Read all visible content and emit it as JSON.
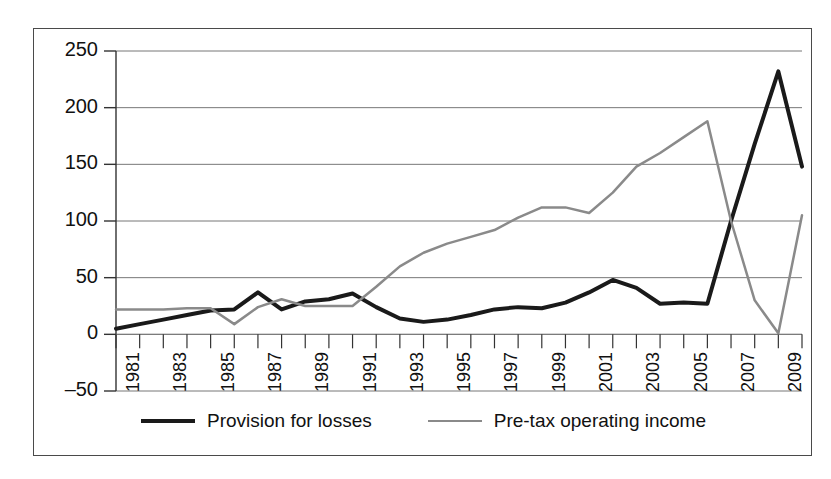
{
  "chart_data": {
    "type": "line",
    "title": "",
    "subtitle": "",
    "xlabel": "",
    "ylabel": "",
    "grid": true,
    "legend_position": "bottom",
    "ylim": [
      -50,
      250
    ],
    "yticks": [
      -50,
      0,
      50,
      100,
      150,
      200,
      250
    ],
    "ytick_labels": [
      "–50",
      "0",
      "50",
      "100",
      "150",
      "200",
      "250"
    ],
    "x": [
      1981,
      1982,
      1983,
      1984,
      1985,
      1986,
      1987,
      1988,
      1989,
      1990,
      1991,
      1992,
      1993,
      1994,
      1995,
      1996,
      1997,
      1998,
      1999,
      2000,
      2001,
      2002,
      2003,
      2004,
      2005,
      2006,
      2007,
      2008,
      2009,
      2010
    ],
    "xtick_labels": [
      "1981",
      "1983",
      "1985",
      "1987",
      "1989",
      "1991",
      "1993",
      "1995",
      "1997",
      "1999",
      "2001",
      "2003",
      "2005",
      "2007",
      "2009"
    ],
    "xtick_values": [
      1981,
      1983,
      1985,
      1987,
      1989,
      1991,
      1993,
      1995,
      1997,
      1999,
      2001,
      2003,
      2005,
      2007,
      2009
    ],
    "xlim": [
      1981,
      2010
    ],
    "series": [
      {
        "name": "Provision for losses",
        "color": "#1a1a1a",
        "width": 4,
        "values": [
          5,
          9,
          13,
          17,
          21,
          22,
          37,
          22,
          29,
          31,
          36,
          24,
          14,
          11,
          13,
          17,
          22,
          24,
          23,
          28,
          37,
          48,
          41,
          27,
          28,
          27,
          100,
          168,
          232,
          148
        ]
      },
      {
        "name": "Pre-tax operating income",
        "color": "#8a8a8a",
        "width": 2.5,
        "values": [
          22,
          22,
          22,
          23,
          23,
          9,
          24,
          31,
          25,
          25,
          25,
          42,
          60,
          72,
          80,
          86,
          92,
          103,
          112,
          112,
          107,
          125,
          148,
          160,
          174,
          188,
          100,
          30,
          1,
          105
        ]
      }
    ]
  },
  "legend": {
    "items": [
      {
        "label": "Provision for losses",
        "swatch": "black-line-swatch"
      },
      {
        "label": "Pre-tax operating income",
        "swatch": "gray-line-swatch"
      }
    ]
  }
}
